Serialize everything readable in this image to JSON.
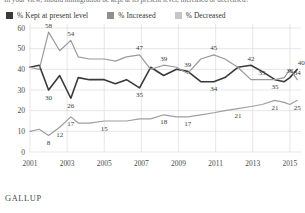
{
  "question": "In your view, should immigration be kept at its present level, increased or decreased?",
  "brand": "GALLUP",
  "legend": {
    "items": [
      {
        "label": "% Kept at present level",
        "color": "#3a3a3a",
        "name": "kept"
      },
      {
        "label": "% Increased",
        "color": "#8f8f8f",
        "name": "increased"
      },
      {
        "label": "% Decreased",
        "color": "#c6c6c6",
        "name": "decreased"
      }
    ]
  },
  "chart_data": {
    "type": "line",
    "title": "",
    "subtitle": "",
    "xlabel": "",
    "ylabel": "",
    "grid": true,
    "legend_position": "top",
    "ylim": [
      0,
      60
    ],
    "yticks": [
      0,
      10,
      20,
      30,
      40,
      50,
      60
    ],
    "xlim": [
      2001,
      2015.6
    ],
    "xticks": [
      2001,
      2003,
      2005,
      2007,
      2009,
      2011,
      2013,
      2015
    ],
    "xticklabels": [
      "2001",
      "2003",
      "2005",
      "2007",
      "2009",
      "2011",
      "2013",
      "2015"
    ],
    "series": [
      {
        "name": "% Kept at present level",
        "color": "#3a3a3a",
        "x": [
          2001.0,
          2001.5,
          2002.0,
          2002.6,
          2003.2,
          2003.6,
          2004.2,
          2005.0,
          2005.6,
          2006.2,
          2006.9,
          2007.5,
          2008.2,
          2008.9,
          2009.5,
          2010.2,
          2010.9,
          2011.5,
          2012.2,
          2012.9,
          2013.5,
          2014.2,
          2014.7,
          2015.0,
          2015.4
        ],
        "values": [
          41,
          42,
          30,
          37,
          26,
          36,
          35,
          35,
          33,
          35,
          31,
          41,
          37,
          40,
          39,
          34,
          34,
          36,
          41,
          42,
          39,
          35,
          34,
          36,
          40
        ],
        "labels": [
          {
            "x": 2002.0,
            "value": 30,
            "text": "30"
          },
          {
            "x": 2003.2,
            "value": 26,
            "text": "26"
          },
          {
            "x": 2006.9,
            "value": 31,
            "text": "35"
          },
          {
            "x": 2009.5,
            "value": 39,
            "text": "39"
          },
          {
            "x": 2010.9,
            "value": 34,
            "text": "34"
          },
          {
            "x": 2012.9,
            "value": 42,
            "text": "42"
          },
          {
            "x": 2014.2,
            "value": 35,
            "text": "35"
          },
          {
            "x": 2015.0,
            "value": 36,
            "text": "36"
          },
          {
            "x": 2015.4,
            "value": 40,
            "text": "40"
          }
        ]
      },
      {
        "name": "% Increased",
        "color": "#9a9a9a",
        "x": [
          2001.0,
          2001.5,
          2002.0,
          2002.6,
          2003.2,
          2003.6,
          2004.2,
          2005.0,
          2005.6,
          2006.2,
          2006.9,
          2007.5,
          2008.2,
          2008.9,
          2009.5,
          2010.2,
          2010.9,
          2011.5,
          2012.2,
          2012.9,
          2013.5,
          2014.2,
          2014.7,
          2015.0,
          2015.4
        ],
        "values": [
          41,
          40,
          58,
          49,
          54,
          46,
          45,
          45,
          44,
          46,
          47,
          40,
          42,
          41,
          38,
          45,
          47,
          45,
          41,
          35,
          35,
          35,
          36,
          40,
          35
        ],
        "labels": [
          {
            "x": 2002.0,
            "value": 58,
            "text": "58"
          },
          {
            "x": 2003.2,
            "value": 54,
            "text": "54"
          },
          {
            "x": 2006.9,
            "value": 47,
            "text": "47"
          },
          {
            "x": 2008.2,
            "value": 42,
            "text": "39"
          },
          {
            "x": 2010.9,
            "value": 47,
            "text": "45"
          },
          {
            "x": 2013.5,
            "value": 35,
            "text": "35"
          },
          {
            "x": 2015.4,
            "value": 35,
            "text": "34"
          }
        ]
      },
      {
        "name": "% Decreased",
        "color": "#9e9e9e",
        "x": [
          2001.0,
          2001.5,
          2002.0,
          2002.6,
          2003.2,
          2003.6,
          2004.2,
          2005.0,
          2005.6,
          2006.2,
          2006.9,
          2007.5,
          2008.2,
          2008.9,
          2009.5,
          2010.2,
          2010.9,
          2011.5,
          2012.2,
          2012.9,
          2013.5,
          2014.2,
          2014.7,
          2015.0,
          2015.4
        ],
        "values": [
          10,
          11,
          8,
          12,
          17,
          14,
          14,
          15,
          15,
          15,
          16,
          16,
          18,
          17,
          17,
          18,
          19,
          20,
          21,
          22,
          23,
          25,
          24,
          23,
          25
        ],
        "labels": [
          {
            "x": 2002.0,
            "value": 8,
            "text": "8"
          },
          {
            "x": 2002.6,
            "value": 12,
            "text": "12"
          },
          {
            "x": 2003.2,
            "value": 17,
            "text": "17"
          },
          {
            "x": 2005.0,
            "value": 15,
            "text": "15"
          },
          {
            "x": 2008.2,
            "value": 18,
            "text": "18"
          },
          {
            "x": 2009.5,
            "value": 17,
            "text": "17"
          },
          {
            "x": 2012.2,
            "value": 21,
            "text": "21"
          },
          {
            "x": 2014.2,
            "value": 25,
            "text": "21"
          },
          {
            "x": 2015.4,
            "value": 25,
            "text": "25"
          }
        ]
      }
    ]
  }
}
